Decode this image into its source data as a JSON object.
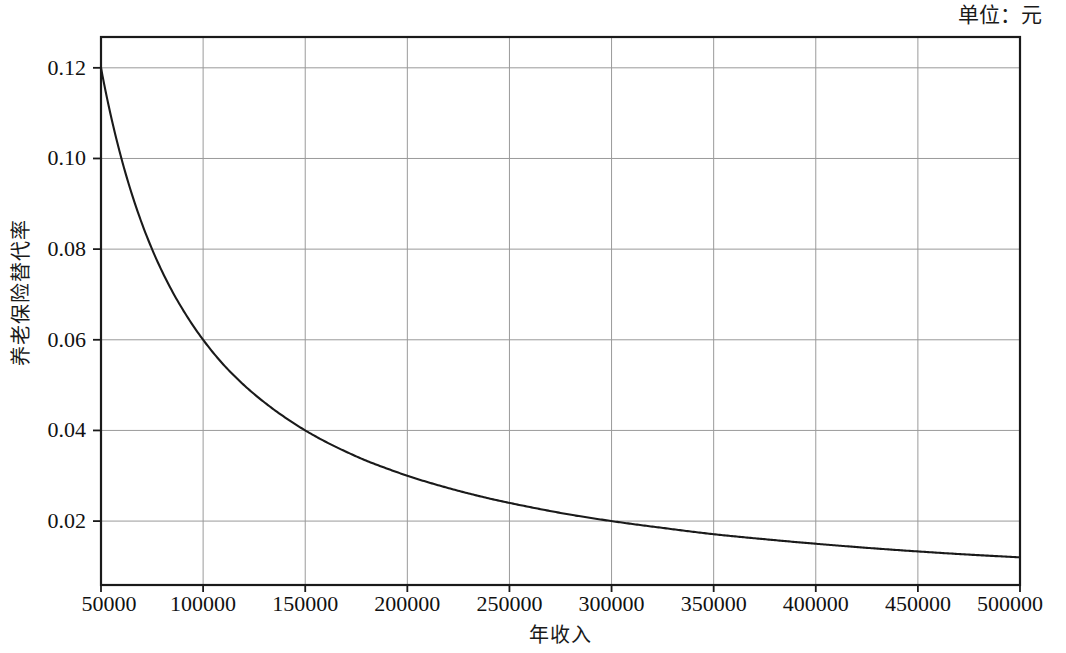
{
  "annotations": {
    "unit_note": "单位：元"
  },
  "chart_data": {
    "type": "line",
    "title": "",
    "subtitle": "",
    "xlabel": "年收入",
    "ylabel": "养老保险替代率",
    "unit_note": "单位：元",
    "grid": true,
    "legend": null,
    "legend_position": "none",
    "xlim": [
      50000,
      500000
    ],
    "ylim": [
      0.0059,
      0.1268
    ],
    "xticks": [
      50000,
      100000,
      150000,
      200000,
      250000,
      300000,
      350000,
      400000,
      450000,
      500000
    ],
    "xtick_labels": [
      "50000",
      "100000",
      "150000",
      "200000",
      "250000",
      "300000",
      "350000",
      "400000",
      "450000",
      "500000"
    ],
    "yticks": [
      0.02,
      0.04,
      0.06,
      0.08,
      0.1,
      0.12
    ],
    "ytick_labels": [
      "0.02",
      "0.04",
      "0.06",
      "0.08",
      "0.10",
      "0.12"
    ],
    "line_color": "#1a1a1a",
    "grid_color": "#9a9a9a",
    "axis_color": "#1a1a1a",
    "series": [
      {
        "name": "养老保险替代率",
        "x": [
          50000,
          60000,
          70000,
          80000,
          90000,
          100000,
          110000,
          120000,
          130000,
          140000,
          150000,
          160000,
          170000,
          180000,
          190000,
          200000,
          220000,
          240000,
          260000,
          280000,
          300000,
          325000,
          350000,
          375000,
          400000,
          425000,
          450000,
          475000,
          500000
        ],
        "values": [
          0.12,
          0.1,
          0.0857,
          0.075,
          0.0667,
          0.06,
          0.0545,
          0.05,
          0.0462,
          0.0429,
          0.04,
          0.0375,
          0.0353,
          0.0333,
          0.0316,
          0.03,
          0.0273,
          0.025,
          0.0231,
          0.0214,
          0.02,
          0.0185,
          0.0171,
          0.016,
          0.015,
          0.0141,
          0.0133,
          0.0126,
          0.012
        ]
      }
    ]
  }
}
